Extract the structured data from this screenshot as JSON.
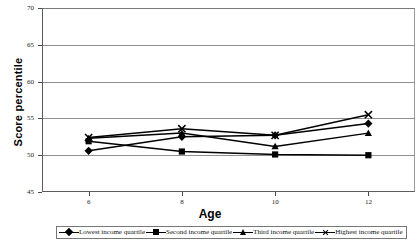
{
  "chart_data": {
    "type": "line",
    "title": "",
    "xlabel": "Age",
    "ylabel": "Score percentile",
    "categories": [
      6,
      8,
      10,
      12
    ],
    "x_tick_labels": [
      "6",
      "8",
      "10",
      "12"
    ],
    "y_tick_labels": [
      "45",
      "50",
      "55",
      "60",
      "65",
      "70"
    ],
    "y_ticks": [
      45,
      50,
      55,
      60,
      65,
      70
    ],
    "ylim": [
      45,
      70
    ],
    "xlim": [
      5,
      13
    ],
    "grid": "horizontal",
    "legend_position": "bottom",
    "series": [
      {
        "name": "Lowest income quartile",
        "marker": "diamond",
        "color": "#000000",
        "values": [
          50.6,
          52.5,
          52.7,
          54.3
        ]
      },
      {
        "name": "Second income quartile",
        "marker": "square",
        "color": "#000000",
        "values": [
          51.9,
          50.5,
          50.1,
          50.0
        ]
      },
      {
        "name": "Third income quartile",
        "marker": "triangle",
        "color": "#000000",
        "values": [
          52.3,
          53.0,
          51.2,
          53.0
        ]
      },
      {
        "name": "Highest income quartile",
        "marker": "cross",
        "color": "#000000",
        "values": [
          52.4,
          53.6,
          52.7,
          55.5
        ]
      }
    ]
  },
  "axes": {
    "y_axis_title": "Score percentile",
    "x_axis_title": "Age"
  },
  "legend": {
    "items": [
      {
        "label": "Lowest income quartile",
        "marker": "diamond"
      },
      {
        "label": "Second income quartile",
        "marker": "square"
      },
      {
        "label": "Third income quartile",
        "marker": "triangle"
      },
      {
        "label": "Highest income quartile",
        "marker": "cross"
      }
    ]
  }
}
